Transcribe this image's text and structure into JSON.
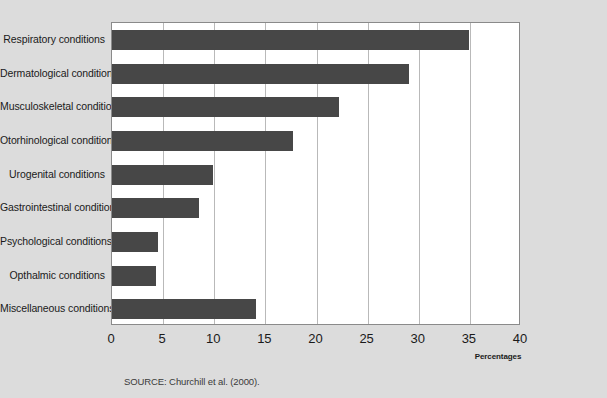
{
  "chart_data": {
    "type": "bar",
    "orientation": "horizontal",
    "title": "",
    "subtitle": "",
    "xlabel": "Percentages",
    "ylabel": "",
    "xlim": [
      0,
      40
    ],
    "xticks": [
      "0",
      "5",
      "10",
      "15",
      "20",
      "25",
      "30",
      "35",
      "40"
    ],
    "xtick_values": [
      0,
      5,
      10,
      15,
      20,
      25,
      30,
      35,
      40
    ],
    "grid": "vertical",
    "legend": "none",
    "categories": [
      "Respiratory conditions",
      "Dermatological conditions",
      "Musculoskeletal conditions",
      "Otorhinological conditions",
      "Urogenital conditions",
      "Gastrointestinal conditions",
      "Psychological conditions",
      "Opthalmic conditions",
      "Miscellaneous conditions"
    ],
    "values": [
      34.9,
      29.0,
      22.2,
      17.7,
      9.9,
      8.5,
      4.5,
      4.3,
      14.1
    ],
    "series": [
      {
        "name": "Percentages",
        "values": [
          34.9,
          29.0,
          22.2,
          17.7,
          9.9,
          8.5,
          4.5,
          4.3,
          14.1
        ]
      }
    ]
  },
  "source": {
    "note": "SOURCE: Churchill et al. (2000)."
  },
  "colors": {
    "bar": "#474747",
    "background": "#dcdcdc",
    "plot_background": "#ffffff",
    "gridline": "#b9b9b9",
    "frame": "#8a8a8a",
    "text": "#1a1a1a"
  }
}
